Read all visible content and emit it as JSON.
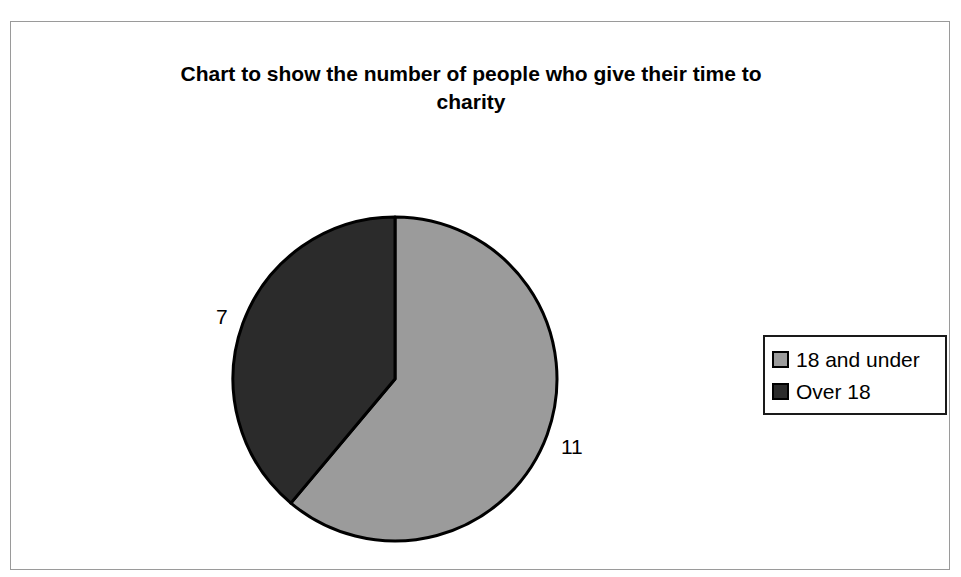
{
  "chart_data": {
    "type": "pie",
    "title": "Chart to show the number of people who give their time to charity",
    "title_line1": "Chart to show the number of people who give their time to",
    "title_line2": "charity",
    "categories": [
      "18 and under",
      "Over 18"
    ],
    "values": [
      11,
      7
    ],
    "total": 18,
    "data_labels": [
      "11",
      "7"
    ],
    "colors": [
      "#9b9b9b",
      "#2b2b2b"
    ],
    "slice_border_color": "#000000",
    "start_angle_deg": 0,
    "direction": "clockwise",
    "slices": [
      {
        "label": "18 and under",
        "value": 11,
        "color": "#9b9b9b",
        "sweep_deg": 220,
        "percent": "61.1%"
      },
      {
        "label": "Over 18",
        "value": 7,
        "color": "#2b2b2b",
        "sweep_deg": 140,
        "percent": "38.9%"
      }
    ],
    "legend": {
      "position": "right",
      "entries": [
        {
          "label": "18 and under",
          "color": "#9b9b9b"
        },
        {
          "label": "Over 18",
          "color": "#2b2b2b"
        }
      ]
    },
    "grid": false,
    "xlabel": "",
    "ylabel": ""
  },
  "frame": {
    "border_color": "#9a9a9a"
  }
}
